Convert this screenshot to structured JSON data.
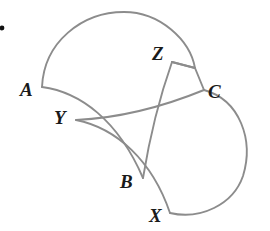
{
  "figure": {
    "canvas": {
      "width": 270,
      "height": 231,
      "background": "#ffffff"
    },
    "stroke": {
      "color": "#8c8c8c",
      "width": 1.9
    },
    "label_color": "#1a1a1a",
    "bullet": {
      "name": "bullet-dot",
      "x": 2,
      "y": 28,
      "radius": 2.4,
      "color": "#111111"
    },
    "vertices": [
      {
        "id": "A",
        "label": "A",
        "x": 42,
        "y": 87,
        "label_x": 20,
        "label_y": 80
      },
      {
        "id": "B",
        "label": "B",
        "x": 143,
        "y": 178,
        "label_x": 120,
        "label_y": 172
      },
      {
        "id": "C",
        "label": "C",
        "x": 204,
        "y": 90,
        "label_x": 208,
        "label_y": 82
      },
      {
        "id": "X",
        "label": "X",
        "x": 170,
        "y": 213,
        "label_x": 149,
        "label_y": 206
      },
      {
        "id": "Y",
        "label": "Y",
        "x": 76,
        "y": 120,
        "label_x": 54,
        "label_y": 108
      },
      {
        "id": "Z",
        "label": "Z",
        "x": 172,
        "y": 62,
        "label_x": 152,
        "label_y": 44
      }
    ],
    "paths": [
      {
        "name": "arc-A-to-Z-top",
        "d": "M 42 87 C 44 42 82 12 124 12 C 160 12 190 40 195 68 L 172 62"
      },
      {
        "name": "curve-A-to-B-lower-left",
        "d": "M 42 87 C 80 92 118 120 143 178"
      },
      {
        "name": "curve-Z-to-B-inner",
        "d": "M 172 62 C 160 96 150 135 143 178"
      },
      {
        "name": "curve-Y-to-C-upper",
        "d": "M 76 120 C 120 118 160 108 204 90"
      },
      {
        "name": "curve-Y-to-X-lower",
        "d": "M 76 120 C 116 128 152 160 170 213"
      },
      {
        "name": "arc-C-to-X-right",
        "d": "M 204 90 C 240 100 254 140 243 176 C 233 205 200 220 170 213"
      },
      {
        "name": "edge-Z-to-C-short",
        "d": "M 172 62 L 195 68"
      },
      {
        "name": "edge-C-corner",
        "d": "M 195 68 L 204 90"
      }
    ]
  }
}
